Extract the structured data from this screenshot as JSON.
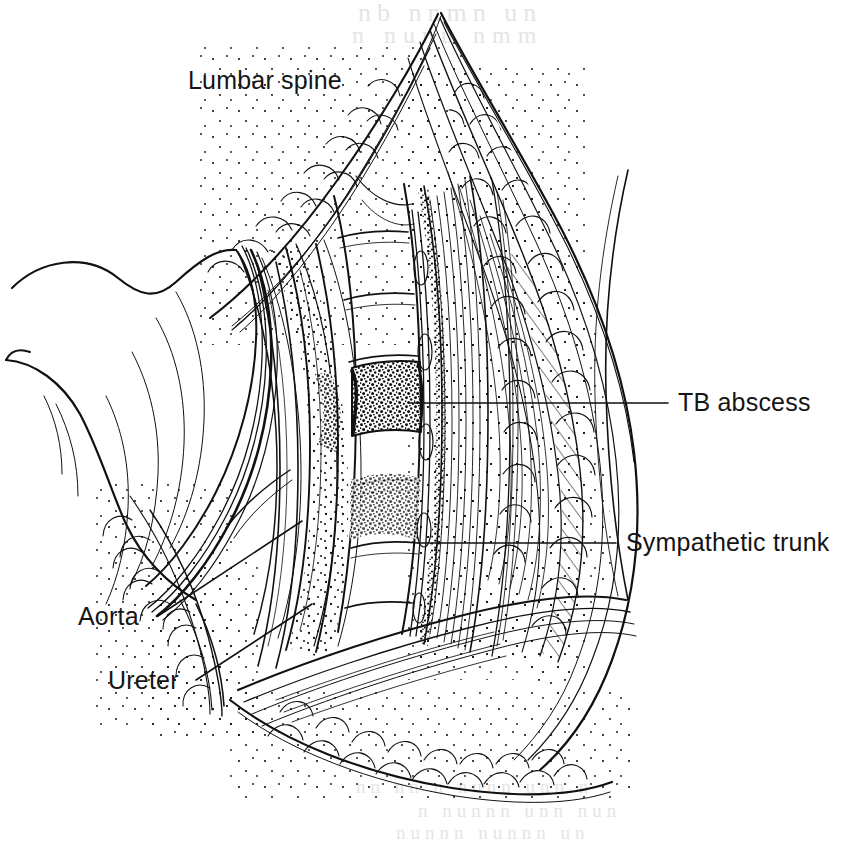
{
  "figure": {
    "kind": "medical-line-illustration",
    "title_visible": false,
    "ink_color": "#111111",
    "paper_color": "#ffffff",
    "width": 842,
    "height": 848
  },
  "labels": {
    "lumbar_spine": "Lumbar spine",
    "tb_abscess": "TB abscess",
    "sympathetic_trunk": "Sympathetic trunk",
    "aorta": "Aorta",
    "ureter": "Ureter"
  },
  "leader_lines": [
    {
      "name": "tb-abscess-leader",
      "x1": 410,
      "y1": 403,
      "x2": 668,
      "y2": 403,
      "style": "straight-horizontal"
    },
    {
      "name": "sympathetic-trunk-leader",
      "x1": 418,
      "y1": 543,
      "x2": 616,
      "y2": 543,
      "style": "straight-horizontal"
    },
    {
      "name": "aorta-leader",
      "x1": 158,
      "y1": 616,
      "x2": 302,
      "y2": 521,
      "style": "straight-diagonal"
    },
    {
      "name": "ureter-leader",
      "x1": 196,
      "y1": 680,
      "x2": 312,
      "y2": 604,
      "style": "straight-diagonal"
    }
  ],
  "structures": [
    {
      "name": "skin-edge-right",
      "label": "Skin margin, right wound edge"
    },
    {
      "name": "subcutaneous-fat",
      "label": "Subcutaneous fat lobules"
    },
    {
      "name": "abdominal-wall-muscle",
      "label": "Divided abdominal wall muscle"
    },
    {
      "name": "retracted-peritoneum",
      "label": "Retracted peritoneal sac and viscera"
    },
    {
      "name": "retractor-blade",
      "label": "Retractor blade"
    },
    {
      "name": "vertebral-column",
      "label": "Lumbar vertebral bodies"
    },
    {
      "name": "tb-abscess-mass",
      "label": "Tuberculous abscess eroding vertebral body"
    },
    {
      "name": "psoas-muscle",
      "label": "Psoas major muscle"
    },
    {
      "name": "sympathetic-chain",
      "label": "Lumbar sympathetic trunk"
    },
    {
      "name": "aorta-vessel",
      "label": "Abdominal aorta"
    },
    {
      "name": "ureter-tube",
      "label": "Ureter"
    },
    {
      "name": "wound-floor",
      "label": "Inferior wound margin"
    }
  ],
  "ghost_artifacts": {
    "note": "faint scanner bleed-through from reverse of page",
    "top_line_1": "nb  nnmn  un",
    "top_line_2": "n nunu  nmm",
    "bottom_line_1": "nn nn  u  nunn   unn n",
    "bottom_line_2": "n nunnn   unn  nun",
    "bottom_line_3": "nunnn    nunnn un"
  }
}
